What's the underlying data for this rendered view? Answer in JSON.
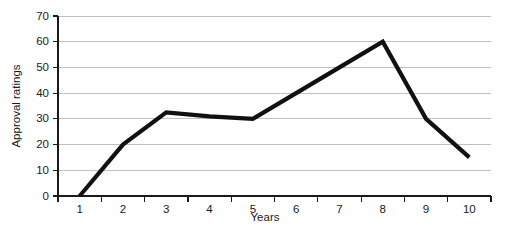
{
  "chart_data": {
    "type": "line",
    "title": "",
    "subtitle": "",
    "xlabel": "Years",
    "ylabel": "Approval ratings",
    "x": [
      1,
      2,
      3,
      4,
      5,
      6,
      7,
      8,
      9,
      10
    ],
    "categories": [
      "1",
      "2",
      "3",
      "4",
      "5",
      "6",
      "7",
      "8",
      "9",
      "10"
    ],
    "values": [
      0,
      20,
      32.5,
      31,
      30,
      40,
      50,
      60,
      30,
      15
    ],
    "series": [
      {
        "name": "Approval ratings",
        "values": [
          0,
          20,
          32.5,
          31,
          30,
          40,
          50,
          60,
          30,
          15
        ]
      }
    ],
    "xlim": [
      1,
      10
    ],
    "ylim": [
      0,
      70
    ],
    "y_ticks": [
      0,
      10,
      20,
      30,
      40,
      50,
      60,
      70
    ],
    "y_tick_labels": [
      "0",
      "10",
      "20",
      "30",
      "40",
      "50",
      "60",
      "70"
    ],
    "x_ticks": [
      1,
      2,
      3,
      4,
      5,
      6,
      7,
      8,
      9,
      10
    ],
    "x_tick_labels": [
      "1",
      "2",
      "3",
      "4",
      "5",
      "6",
      "7",
      "8",
      "9",
      "10"
    ],
    "grid": "horizontal",
    "legend": "none",
    "legend_position": "none",
    "annotations": [],
    "colors": {
      "series_line": "#111111",
      "gridline": "#b9b9b9",
      "axis": "#1a1a1a",
      "background": "#ffffff",
      "text": "#1a1a1a"
    }
  },
  "axes": {
    "y_axis_title": "Approval ratings",
    "x_axis_title": "Years"
  }
}
